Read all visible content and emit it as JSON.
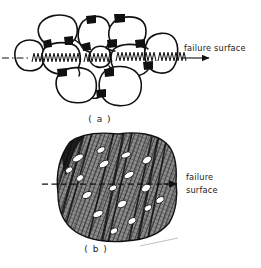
{
  "figure": {
    "background_color": "#ffffff",
    "ink_color": "#111111",
    "panels": [
      {
        "id": "a",
        "caption": "( a )",
        "caption_x": 100,
        "caption_y": 122,
        "description": "intergranular fracture through polycrystalline grain structure with black wedge cavities at grain boundaries",
        "annotation": {
          "text": "failure surface",
          "text_x": 184,
          "text_y": 51,
          "line_style": "dash-dot",
          "line_y": 58,
          "line_x_start": 2,
          "line_x_end": 212,
          "arrow_tip_x": 212
        },
        "grains": [
          {
            "cx": 28,
            "cy": 55,
            "rx": 16,
            "ry": 14
          },
          {
            "cx": 55,
            "cy": 30,
            "rx": 19,
            "ry": 14
          },
          {
            "cx": 60,
            "cy": 58,
            "rx": 19,
            "ry": 15
          },
          {
            "cx": 93,
            "cy": 35,
            "rx": 15,
            "ry": 17
          },
          {
            "cx": 100,
            "cy": 57,
            "rx": 11,
            "ry": 9
          },
          {
            "cx": 126,
            "cy": 31,
            "rx": 17,
            "ry": 13
          },
          {
            "cx": 131,
            "cy": 58,
            "rx": 19,
            "ry": 14
          },
          {
            "cx": 160,
            "cy": 52,
            "rx": 16,
            "ry": 18
          },
          {
            "cx": 77,
            "cy": 84,
            "rx": 19,
            "ry": 15
          },
          {
            "cx": 120,
            "cy": 86,
            "rx": 19,
            "ry": 16
          }
        ],
        "cavities": [
          {
            "x": 47,
            "y": 44
          },
          {
            "x": 68,
            "y": 41
          },
          {
            "x": 86,
            "y": 47
          },
          {
            "x": 91,
            "y": 19
          },
          {
            "x": 112,
            "y": 43
          },
          {
            "x": 119,
            "y": 18
          },
          {
            "x": 140,
            "y": 43
          },
          {
            "x": 62,
            "y": 72
          },
          {
            "x": 109,
            "y": 72
          },
          {
            "x": 101,
            "y": 93
          },
          {
            "x": 148,
            "y": 66
          }
        ],
        "cracked_boundaries": [
          {
            "x1": 34,
            "y1": 58,
            "x2": 80,
            "y2": 58
          },
          {
            "x1": 86,
            "y1": 58,
            "x2": 113,
            "y2": 58
          },
          {
            "x1": 118,
            "y1": 57,
            "x2": 156,
            "y2": 57
          },
          {
            "x1": 160,
            "y1": 57,
            "x2": 185,
            "y2": 57
          }
        ]
      },
      {
        "id": "b",
        "caption": "( b )",
        "caption_x": 96,
        "caption_y": 252,
        "description": "transgranular fracture across a hatched matrix containing white elongated voids and slip bands",
        "annotation": {
          "text_line1": "failure",
          "text_line2": "surface",
          "text_x": 186,
          "text_y1": 180,
          "text_y2": 193,
          "line_style": "dashed",
          "line_y": 184,
          "line_x_start": 42,
          "line_x_end": 180,
          "arrow_tip_x": 180
        },
        "matrix": {
          "fill_pattern": "diagonal-crosshatch",
          "fill_color": "#6e6e6e",
          "bounds": {
            "x": 57,
            "y": 136,
            "w": 120,
            "h": 106
          }
        },
        "voids": [
          {
            "cx": 78,
            "cy": 158,
            "rx": 6,
            "ry": 3,
            "rot": -30
          },
          {
            "cx": 101,
            "cy": 150,
            "rx": 4.5,
            "ry": 2.6,
            "rot": -28
          },
          {
            "cx": 104,
            "cy": 164,
            "rx": 5.5,
            "ry": 3,
            "rot": -32
          },
          {
            "cx": 126,
            "cy": 155,
            "rx": 5,
            "ry": 2.6,
            "rot": -20
          },
          {
            "cx": 147,
            "cy": 160,
            "rx": 5,
            "ry": 3.2,
            "rot": -35
          },
          {
            "cx": 80,
            "cy": 178,
            "rx": 4,
            "ry": 2.8,
            "rot": -40
          },
          {
            "cx": 129,
            "cy": 175,
            "rx": 5.5,
            "ry": 2.8,
            "rot": -30
          },
          {
            "cx": 113,
            "cy": 188,
            "rx": 4,
            "ry": 2.6,
            "rot": -25
          },
          {
            "cx": 146,
            "cy": 188,
            "rx": 5,
            "ry": 3.4,
            "rot": -35
          },
          {
            "cx": 87,
            "cy": 195,
            "rx": 5,
            "ry": 3,
            "rot": -30
          },
          {
            "cx": 122,
            "cy": 204,
            "rx": 5,
            "ry": 3.2,
            "rot": -32
          },
          {
            "cx": 148,
            "cy": 208,
            "rx": 4.2,
            "ry": 2.6,
            "rot": -30
          },
          {
            "cx": 160,
            "cy": 200,
            "rx": 4.5,
            "ry": 2.8,
            "rot": -28
          },
          {
            "cx": 98,
            "cy": 214,
            "rx": 5.5,
            "ry": 3,
            "rot": -25
          },
          {
            "cx": 132,
            "cy": 221,
            "rx": 4.5,
            "ry": 2.8,
            "rot": -30
          },
          {
            "cx": 114,
            "cy": 231,
            "rx": 4,
            "ry": 2.6,
            "rot": -30
          },
          {
            "cx": 69,
            "cy": 170,
            "rx": 4,
            "ry": 2.6,
            "rot": -35
          }
        ]
      }
    ]
  }
}
